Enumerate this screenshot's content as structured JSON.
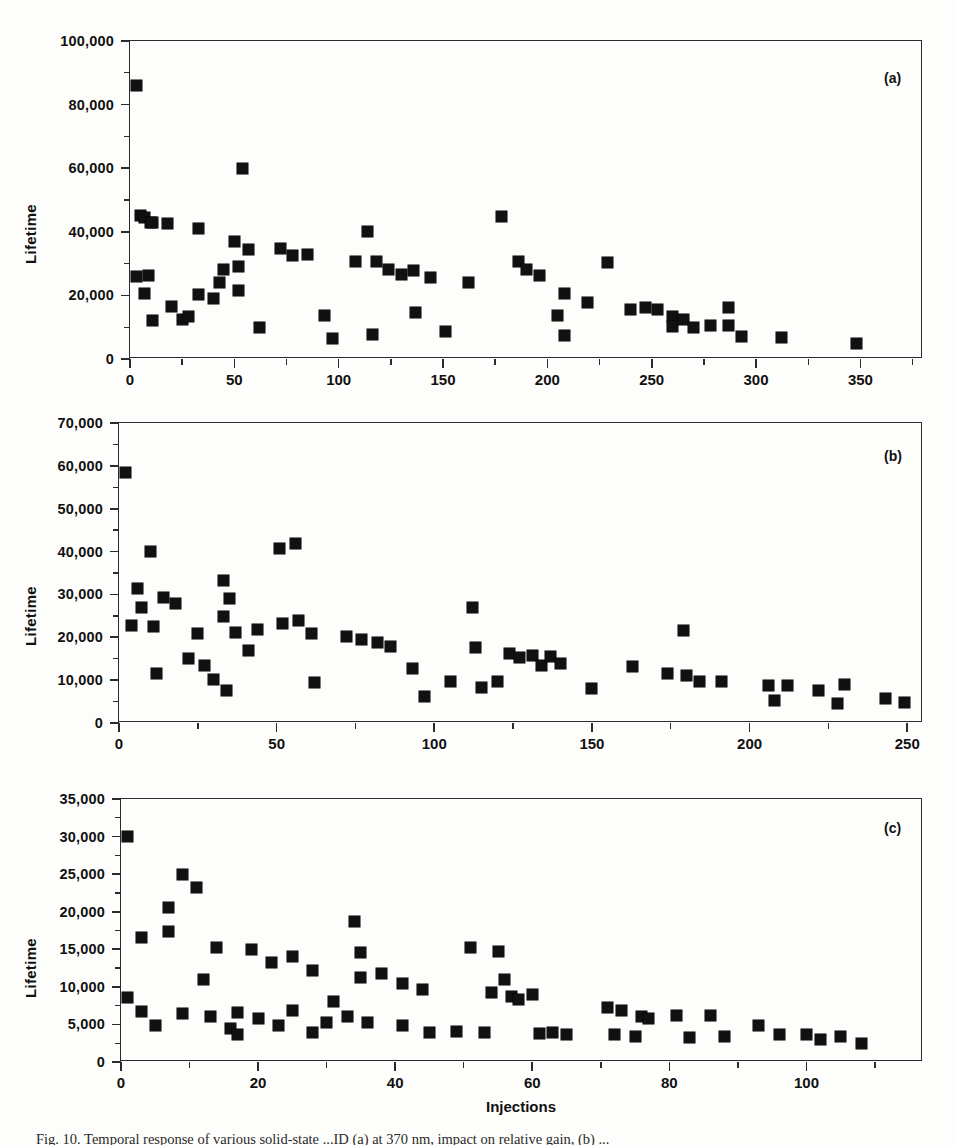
{
  "figure": {
    "caption": "Fig. 10. Temporal response of various solid-state ...ID (a) at 370 nm, impact on relative gain, (b) ...",
    "xlabel": "Injections",
    "ylabel": "Lifetime"
  },
  "chart_data": [
    {
      "type": "scatter",
      "panel": "a",
      "tag": "(a)",
      "title": "",
      "xlabel": "",
      "ylabel": "Lifetime",
      "xlim": [
        0,
        380
      ],
      "ylim": [
        0,
        100000
      ],
      "xticks": [
        0,
        50,
        100,
        150,
        200,
        250,
        300,
        350
      ],
      "xtick_labels": [
        "0",
        "50",
        "100",
        "150",
        "200",
        "250",
        "300",
        "350"
      ],
      "xminor_step": 25,
      "yticks": [
        0,
        20000,
        40000,
        60000,
        80000,
        100000
      ],
      "ytick_labels": [
        "0",
        "20,000",
        "40,000",
        "60,000",
        "80,000",
        "100,000"
      ],
      "yminor_step": 10000,
      "grid": false,
      "legend": null,
      "marker": "filled-square",
      "marker_color": "#111111",
      "points": [
        [
          3,
          86000
        ],
        [
          3,
          26000
        ],
        [
          5,
          45000
        ],
        [
          7,
          44500
        ],
        [
          7,
          20500
        ],
        [
          9,
          26200
        ],
        [
          10,
          43000
        ],
        [
          11,
          42800
        ],
        [
          11,
          12000
        ],
        [
          18,
          42700
        ],
        [
          20,
          16500
        ],
        [
          25,
          12500
        ],
        [
          28,
          13500
        ],
        [
          33,
          41000
        ],
        [
          33,
          20200
        ],
        [
          40,
          19000
        ],
        [
          43,
          24000
        ],
        [
          45,
          28000
        ],
        [
          50,
          37000
        ],
        [
          52,
          29000
        ],
        [
          52,
          21500
        ],
        [
          54,
          59800
        ],
        [
          57,
          34500
        ],
        [
          62,
          9800
        ],
        [
          72,
          34800
        ],
        [
          78,
          32500
        ],
        [
          85,
          33000
        ],
        [
          93,
          13800
        ],
        [
          97,
          6300
        ],
        [
          108,
          30800
        ],
        [
          114,
          40200
        ],
        [
          116,
          7800
        ],
        [
          118,
          30700
        ],
        [
          124,
          28200
        ],
        [
          130,
          26500
        ],
        [
          136,
          27800
        ],
        [
          137,
          14500
        ],
        [
          144,
          25500
        ],
        [
          151,
          8800
        ],
        [
          162,
          24000
        ],
        [
          178,
          44800
        ],
        [
          186,
          30600
        ],
        [
          190,
          28200
        ],
        [
          196,
          26200
        ],
        [
          205,
          13800
        ],
        [
          208,
          20500
        ],
        [
          208,
          7300
        ],
        [
          219,
          17800
        ],
        [
          229,
          30500
        ],
        [
          240,
          15500
        ],
        [
          247,
          16200
        ],
        [
          253,
          15500
        ],
        [
          260,
          13500
        ],
        [
          260,
          10200
        ],
        [
          265,
          12500
        ],
        [
          270,
          10000
        ],
        [
          278,
          10500
        ],
        [
          287,
          16200
        ],
        [
          287,
          10500
        ],
        [
          293,
          7200
        ],
        [
          312,
          6900
        ],
        [
          348,
          4800
        ]
      ]
    },
    {
      "type": "scatter",
      "panel": "b",
      "tag": "(b)",
      "title": "",
      "xlabel": "",
      "ylabel": "Lifetime",
      "xlim": [
        0,
        255
      ],
      "ylim": [
        0,
        70000
      ],
      "xticks": [
        0,
        50,
        100,
        150,
        200,
        250
      ],
      "xtick_labels": [
        "0",
        "50",
        "100",
        "150",
        "200",
        "250"
      ],
      "xminor_step": 25,
      "yticks": [
        0,
        10000,
        20000,
        30000,
        40000,
        50000,
        60000,
        70000
      ],
      "ytick_labels": [
        "0",
        "10,000",
        "20,000",
        "30,000",
        "40,000",
        "50,000",
        "60,000",
        "70,000"
      ],
      "yminor_step": 5000,
      "grid": false,
      "legend": null,
      "marker": "filled-square",
      "marker_color": "#111111",
      "points": [
        [
          2,
          58500
        ],
        [
          4,
          22800
        ],
        [
          6,
          31500
        ],
        [
          7,
          27000
        ],
        [
          10,
          40000
        ],
        [
          11,
          22500
        ],
        [
          12,
          11500
        ],
        [
          14,
          29200
        ],
        [
          18,
          28000
        ],
        [
          22,
          15000
        ],
        [
          25,
          21000
        ],
        [
          27,
          13500
        ],
        [
          30,
          10200
        ],
        [
          33,
          33200
        ],
        [
          33,
          24800
        ],
        [
          34,
          7500
        ],
        [
          35,
          29000
        ],
        [
          37,
          21200
        ],
        [
          41,
          17000
        ],
        [
          44,
          21800
        ],
        [
          51,
          40700
        ],
        [
          52,
          23200
        ],
        [
          56,
          42000
        ],
        [
          57,
          24000
        ],
        [
          61,
          20800
        ],
        [
          62,
          9500
        ],
        [
          72,
          20200
        ],
        [
          77,
          19500
        ],
        [
          82,
          18700
        ],
        [
          86,
          17800
        ],
        [
          93,
          12800
        ],
        [
          97,
          6100
        ],
        [
          105,
          9800
        ],
        [
          112,
          27000
        ],
        [
          113,
          17700
        ],
        [
          115,
          8300
        ],
        [
          120,
          9600
        ],
        [
          124,
          16200
        ],
        [
          127,
          15200
        ],
        [
          131,
          15800
        ],
        [
          134,
          13500
        ],
        [
          137,
          15500
        ],
        [
          140,
          14000
        ],
        [
          150,
          8000
        ],
        [
          163,
          13200
        ],
        [
          174,
          11500
        ],
        [
          179,
          21500
        ],
        [
          180,
          11000
        ],
        [
          184,
          9800
        ],
        [
          191,
          9800
        ],
        [
          206,
          8800
        ],
        [
          208,
          5200
        ],
        [
          212,
          8700
        ],
        [
          222,
          7600
        ],
        [
          228,
          4600
        ],
        [
          230,
          9000
        ],
        [
          243,
          5800
        ],
        [
          249,
          4800
        ]
      ]
    },
    {
      "type": "scatter",
      "panel": "c",
      "tag": "(c)",
      "title": "",
      "xlabel": "Injections",
      "ylabel": "Lifetime",
      "xlim": [
        0,
        117
      ],
      "ylim": [
        0,
        35000
      ],
      "xticks": [
        0,
        20,
        40,
        60,
        80,
        100
      ],
      "xtick_labels": [
        "0",
        "20",
        "40",
        "60",
        "80",
        "100"
      ],
      "xminor_step": 10,
      "yticks": [
        0,
        5000,
        10000,
        15000,
        20000,
        25000,
        30000,
        35000
      ],
      "ytick_labels": [
        "0",
        "5,000",
        "10,000",
        "15,000",
        "20,000",
        "25,000",
        "30,000",
        "35,000"
      ],
      "yminor_step": 2500,
      "grid": false,
      "legend": null,
      "marker": "filled-square",
      "marker_color": "#111111",
      "points": [
        [
          1,
          30000
        ],
        [
          1,
          8600
        ],
        [
          3,
          16600
        ],
        [
          3,
          6700
        ],
        [
          5,
          4800
        ],
        [
          7,
          17400
        ],
        [
          7,
          20600
        ],
        [
          9,
          25000
        ],
        [
          9,
          6500
        ],
        [
          11,
          23200
        ],
        [
          12,
          11000
        ],
        [
          13,
          6100
        ],
        [
          14,
          15200
        ],
        [
          16,
          4500
        ],
        [
          17,
          6600
        ],
        [
          17,
          3700
        ],
        [
          19,
          15000
        ],
        [
          20,
          5800
        ],
        [
          22,
          13200
        ],
        [
          23,
          4900
        ],
        [
          25,
          14100
        ],
        [
          25,
          6900
        ],
        [
          28,
          12200
        ],
        [
          28,
          3900
        ],
        [
          30,
          5200
        ],
        [
          31,
          8000
        ],
        [
          33,
          6000
        ],
        [
          34,
          18700
        ],
        [
          35,
          11200
        ],
        [
          35,
          14600
        ],
        [
          36,
          5200
        ],
        [
          38,
          11800
        ],
        [
          41,
          10500
        ],
        [
          41,
          4900
        ],
        [
          44,
          9600
        ],
        [
          45,
          3900
        ],
        [
          49,
          4000
        ],
        [
          51,
          15300
        ],
        [
          53,
          3900
        ],
        [
          54,
          9300
        ],
        [
          55,
          14700
        ],
        [
          56,
          11000
        ],
        [
          57,
          8700
        ],
        [
          58,
          8300
        ],
        [
          60,
          9000
        ],
        [
          61,
          3800
        ],
        [
          63,
          3900
        ],
        [
          65,
          3600
        ],
        [
          71,
          7200
        ],
        [
          72,
          3600
        ],
        [
          73,
          6900
        ],
        [
          75,
          3400
        ],
        [
          76,
          6100
        ],
        [
          77,
          5800
        ],
        [
          81,
          6200
        ],
        [
          83,
          3200
        ],
        [
          86,
          6200
        ],
        [
          88,
          3400
        ],
        [
          93,
          4800
        ],
        [
          96,
          3700
        ],
        [
          100,
          3700
        ],
        [
          102,
          3000
        ],
        [
          105,
          3400
        ],
        [
          108,
          2400
        ]
      ]
    }
  ]
}
